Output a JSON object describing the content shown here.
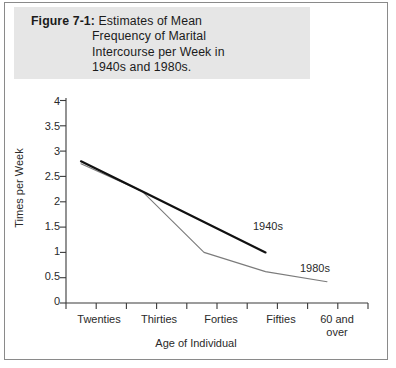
{
  "figure": {
    "caption_label": "Figure 7-1:",
    "caption_lines": [
      "Estimates of Mean",
      "Frequency of Marital",
      "Intercourse per Week in",
      "1940s and 1980s."
    ],
    "band_color": "#e6e6e6"
  },
  "chart_data": {
    "type": "line",
    "title": "Estimates of Mean Frequency of Marital Intercourse per Week in 1940s and 1980s.",
    "xlabel": "Age of Individual",
    "ylabel": "Times per Week",
    "categories": [
      "Twenties",
      "Thirties",
      "Forties",
      "Fifties",
      "60 and over"
    ],
    "category_labels_multiline": [
      [
        "Twenties"
      ],
      [
        "Thirties"
      ],
      [
        "Forties"
      ],
      [
        "Fifties"
      ],
      [
        "60 and",
        "over"
      ]
    ],
    "ylim": [
      0,
      4
    ],
    "yticks": [
      0,
      0.5,
      1,
      1.5,
      2,
      2.5,
      3,
      3.5,
      4
    ],
    "ytick_labels": [
      "0",
      "0.5",
      "1",
      "1.5",
      "2",
      "2.5",
      "3",
      "3.5",
      "4"
    ],
    "grid": false,
    "legend": "inline-annotations",
    "series": [
      {
        "name": "1940s",
        "color": "#111111",
        "width": 2.2,
        "values": [
          2.8,
          2.2,
          1.6,
          1.0,
          null
        ],
        "label_x_category": "Fifties",
        "label_text": "1940s"
      },
      {
        "name": "1980s",
        "color": "#7b7b7b",
        "width": 1.1,
        "values": [
          2.75,
          2.2,
          1.0,
          0.62,
          0.42
        ],
        "label_x_category": "60 and over",
        "label_text": "1980s"
      }
    ]
  }
}
